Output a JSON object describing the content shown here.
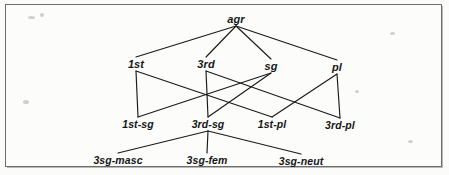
{
  "figure": {
    "kind": "type-hierarchy-diagram",
    "title_text": "",
    "border_color": "#6d6d6d",
    "line_color": "#1a1a1a",
    "text_color": "#161616",
    "background_color": "#fcfcfb"
  },
  "chart_data": {
    "type": "diagram",
    "title": "",
    "nodes": [
      {
        "id": "agr",
        "label": "agr",
        "level": 0,
        "x": 236,
        "y": 19
      },
      {
        "id": "1st",
        "label": "1st",
        "level": 1,
        "x": 136,
        "y": 64
      },
      {
        "id": "3rd",
        "label": "3rd",
        "level": 1,
        "x": 206,
        "y": 64
      },
      {
        "id": "sg",
        "label": "sg",
        "level": 1,
        "x": 271,
        "y": 66
      },
      {
        "id": "pl",
        "label": "pl",
        "level": 1,
        "x": 337,
        "y": 67
      },
      {
        "id": "1st-sg",
        "label": "1st-sg",
        "level": 2,
        "x": 138,
        "y": 124
      },
      {
        "id": "3rd-sg",
        "label": "3rd-sg",
        "level": 2,
        "x": 208,
        "y": 124
      },
      {
        "id": "1st-pl",
        "label": "1st-pl",
        "level": 2,
        "x": 272,
        "y": 124
      },
      {
        "id": "3rd-pl",
        "label": "3rd-pl",
        "level": 2,
        "x": 340,
        "y": 125
      },
      {
        "id": "3sg-masc",
        "label": "3sg-masc",
        "level": 3,
        "x": 118,
        "y": 160
      },
      {
        "id": "3sg-fem",
        "label": "3sg-fem",
        "level": 3,
        "x": 207,
        "y": 160
      },
      {
        "id": "3sg-neut",
        "label": "3sg-neut",
        "level": 3,
        "x": 301,
        "y": 161
      }
    ],
    "edges": [
      {
        "from": "agr",
        "to": "1st"
      },
      {
        "from": "agr",
        "to": "3rd"
      },
      {
        "from": "agr",
        "to": "sg"
      },
      {
        "from": "agr",
        "to": "pl"
      },
      {
        "from": "1st",
        "to": "1st-sg"
      },
      {
        "from": "1st",
        "to": "1st-pl"
      },
      {
        "from": "3rd",
        "to": "3rd-sg"
      },
      {
        "from": "3rd",
        "to": "3rd-pl"
      },
      {
        "from": "sg",
        "to": "1st-sg"
      },
      {
        "from": "sg",
        "to": "3rd-sg"
      },
      {
        "from": "pl",
        "to": "1st-pl"
      },
      {
        "from": "pl",
        "to": "3rd-pl"
      },
      {
        "from": "3rd-sg",
        "to": "3sg-masc"
      },
      {
        "from": "3rd-sg",
        "to": "3sg-fem"
      },
      {
        "from": "3rd-sg",
        "to": "3sg-neut"
      }
    ],
    "legend": [],
    "annotations": []
  }
}
